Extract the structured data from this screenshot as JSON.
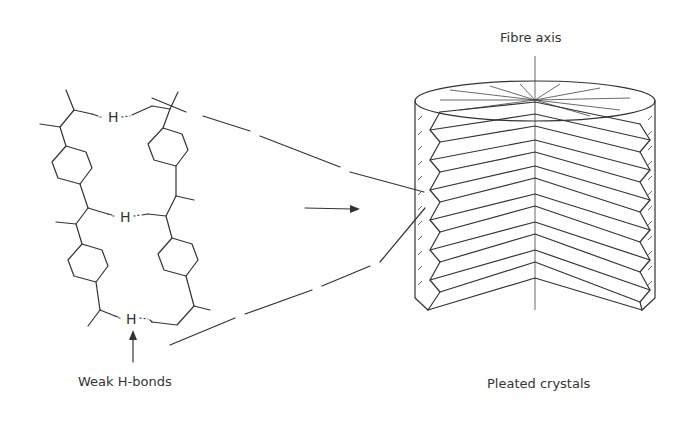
{
  "diagram": {
    "labels": {
      "fibre_axis": "Fibre axis",
      "weak_h_bonds": "Weak H-bonds",
      "pleated_crystals": "Pleated crystals"
    },
    "hydrogen_atom": "H",
    "h_bond_count": 3,
    "left_panel": "Molecular chains (two parallel chains with para-phenylene rings joined by weak H-bonds)",
    "right_panel": "Cylindrical fibre section with radial pleated crystal sheets",
    "arrow": "magnification arrow from chain view to fibre cross-section"
  }
}
